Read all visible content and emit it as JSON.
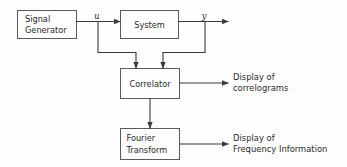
{
  "diagram": {
    "colors": {
      "background": "#fdfdfd",
      "box_stroke": "#5a5a5a",
      "wire": "#3a3a3a",
      "text": "#2a2a2a"
    },
    "blocks": [
      {
        "id": "signal-generator",
        "line1": "Signal",
        "line2": "Generator"
      },
      {
        "id": "system",
        "line1": "System",
        "line2": ""
      },
      {
        "id": "correlator",
        "line1": "Correlator",
        "line2": ""
      },
      {
        "id": "fourier-transform",
        "line1": "Fourier",
        "line2": "Transform"
      }
    ],
    "signals": [
      {
        "id": "input-signal-u",
        "label": "u"
      },
      {
        "id": "output-signal-y",
        "label": "y"
      }
    ],
    "outputs": [
      {
        "id": "correlator-output",
        "line1": "Display of",
        "line2": "correlograms"
      },
      {
        "id": "fourier-output",
        "line1": "Display of",
        "line2": "Frequency Information"
      }
    ]
  }
}
